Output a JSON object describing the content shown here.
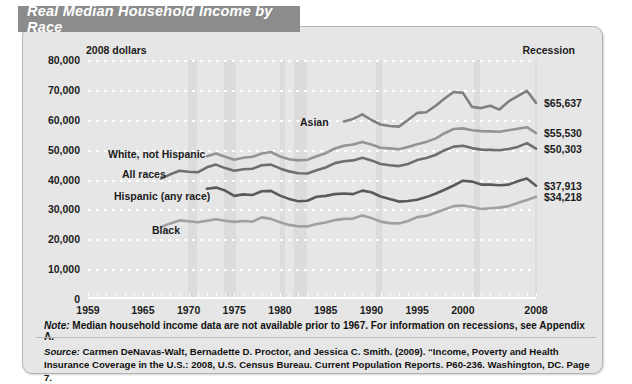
{
  "title": "Real Median Household Income by Race",
  "units_label": "2008 dollars",
  "recession_label": "Recession",
  "note": "Note: Median household income data are not available prior to 1967. For information on recessions, see Appendix A.",
  "note_prefix": "Note:",
  "note_body": " Median household income data are not available prior to 1967. For information on recessions, see Appendix A.",
  "source_prefix": "Source:",
  "source_body": " Carmen DeNavas-Walt, Bernadette D. Proctor, and Jessica C. Smith. (2009). “Income, Poverty and Health Insurance Coverage in the U.S.:  2008, U.S. Census Bureau. Current Population Reports. P60-236. Washington, DC. Page 7.",
  "colors": {
    "banner": "#8c8c8c",
    "card": "#e6e6e6",
    "recession_band": "#dcdcdc",
    "asian": "#808080",
    "white_not_hispanic": "#949494",
    "all_races": "#6e6e6e",
    "hispanic": "#5a5a5a",
    "black": "#a0a0a0"
  },
  "end_labels": [
    {
      "id": "asian",
      "text": "$65,637",
      "value": 65637
    },
    {
      "id": "white_not_hispanic",
      "text": "$55,530",
      "value": 55530
    },
    {
      "id": "all_races",
      "text": "$50,303",
      "value": 50303
    },
    {
      "id": "hispanic",
      "text": "$37,913",
      "value": 37913
    },
    {
      "id": "black",
      "text": "$34,218",
      "value": 34218
    }
  ],
  "inline_labels": [
    {
      "id": "asian",
      "text": "Asian"
    },
    {
      "id": "white_not_hispanic",
      "text": "White, not Hispanic"
    },
    {
      "id": "all_races",
      "text": "All races"
    },
    {
      "id": "hispanic",
      "text": "Hispanic (any race)"
    },
    {
      "id": "black",
      "text": "Black"
    }
  ],
  "chart_data": {
    "type": "line",
    "title": "Real Median Household Income by Race",
    "xlabel": "",
    "ylabel": "2008 dollars",
    "xlim": [
      1959,
      2008
    ],
    "ylim": [
      0,
      80000
    ],
    "ytick_labels": [
      "0",
      "10,000",
      "20,000",
      "30,000",
      "40,000",
      "50,000",
      "60,000",
      "70,000",
      "80,000"
    ],
    "yticks": [
      0,
      10000,
      20000,
      30000,
      40000,
      50000,
      60000,
      70000,
      80000
    ],
    "xtick_labels": [
      "1959",
      "1965",
      "1970",
      "1975",
      "1980",
      "1985",
      "1990",
      "1995",
      "2000",
      "2008"
    ],
    "xticks": [
      1959,
      1965,
      1970,
      1975,
      1980,
      1985,
      1990,
      1995,
      2000,
      2008
    ],
    "grid": "horizontal-dotted",
    "legend": "inline-annotations",
    "recession_bands": [
      [
        1969.9,
        1970.9
      ],
      [
        1973.9,
        1975.2
      ],
      [
        1980.0,
        1980.6
      ],
      [
        1981.5,
        1982.9
      ],
      [
        1990.5,
        1991.2
      ],
      [
        2001.2,
        2001.9
      ],
      [
        2007.9,
        2008.0
      ]
    ],
    "series": [
      {
        "name": "Asian",
        "color": "#808080",
        "x": [
          1987,
          1988,
          1989,
          1990,
          1991,
          1992,
          1993,
          1994,
          1995,
          1996,
          1997,
          1998,
          1999,
          2000,
          2001,
          2002,
          2003,
          2004,
          2005,
          2006,
          2007,
          2008
        ],
        "values": [
          59400,
          60300,
          61800,
          59900,
          58400,
          57900,
          57700,
          59900,
          62300,
          62500,
          64600,
          67100,
          69300,
          69000,
          64300,
          63900,
          64700,
          63400,
          66100,
          67900,
          69700,
          65637
        ]
      },
      {
        "name": "White, not Hispanic",
        "color": "#949494",
        "x": [
          1972,
          1973,
          1974,
          1975,
          1976,
          1977,
          1978,
          1979,
          1980,
          1981,
          1982,
          1983,
          1984,
          1985,
          1986,
          1987,
          1988,
          1989,
          1990,
          1991,
          1992,
          1993,
          1994,
          1995,
          1996,
          1997,
          1998,
          1999,
          2000,
          2001,
          2002,
          2003,
          2004,
          2005,
          2006,
          2007,
          2008
        ],
        "values": [
          47800,
          48700,
          47600,
          46600,
          47300,
          47600,
          48700,
          49200,
          47700,
          46800,
          46400,
          46600,
          47800,
          48800,
          50400,
          51300,
          51700,
          52600,
          51700,
          50600,
          50400,
          50100,
          50900,
          51800,
          52600,
          53700,
          55500,
          56900,
          57100,
          56500,
          56200,
          56100,
          56000,
          56500,
          57000,
          57500,
          55530
        ]
      },
      {
        "name": "All races",
        "color": "#6e6e6e",
        "x": [
          1967,
          1968,
          1969,
          1970,
          1971,
          1972,
          1973,
          1974,
          1975,
          1976,
          1977,
          1978,
          1979,
          1980,
          1981,
          1982,
          1983,
          1984,
          1985,
          1986,
          1987,
          1988,
          1989,
          1990,
          1991,
          1992,
          1993,
          1994,
          1995,
          1996,
          1997,
          1998,
          1999,
          2000,
          2001,
          2002,
          2003,
          2004,
          2005,
          2006,
          2007,
          2008
        ],
        "values": [
          40300,
          41700,
          42900,
          42600,
          42400,
          44100,
          45000,
          43800,
          42900,
          43400,
          43600,
          44800,
          45000,
          43700,
          42700,
          42100,
          42000,
          43100,
          44000,
          45500,
          46100,
          46400,
          47300,
          46400,
          45200,
          44800,
          44500,
          45200,
          46500,
          47200,
          48200,
          49800,
          51000,
          51300,
          50500,
          50000,
          49900,
          49800,
          50200,
          50900,
          52200,
          50303
        ]
      },
      {
        "name": "Hispanic (any race)",
        "color": "#5a5a5a",
        "x": [
          1972,
          1973,
          1974,
          1975,
          1976,
          1977,
          1978,
          1979,
          1980,
          1981,
          1982,
          1983,
          1984,
          1985,
          1986,
          1987,
          1988,
          1989,
          1990,
          1991,
          1992,
          1993,
          1994,
          1995,
          1996,
          1997,
          1998,
          1999,
          2000,
          2001,
          2002,
          2003,
          2004,
          2005,
          2006,
          2007,
          2008
        ],
        "values": [
          36900,
          37300,
          36300,
          34500,
          35000,
          34800,
          36100,
          36200,
          34600,
          33500,
          32700,
          32900,
          34200,
          34500,
          35100,
          35300,
          35100,
          36300,
          35700,
          34300,
          33500,
          32600,
          32800,
          33200,
          34100,
          35200,
          36600,
          38000,
          39600,
          39300,
          38300,
          38300,
          38100,
          38300,
          39400,
          40300,
          37913
        ]
      },
      {
        "name": "Black",
        "color": "#a0a0a0",
        "x": [
          1967,
          1968,
          1969,
          1970,
          1971,
          1972,
          1973,
          1974,
          1975,
          1976,
          1977,
          1978,
          1979,
          1980,
          1981,
          1982,
          1983,
          1984,
          1985,
          1986,
          1987,
          1988,
          1989,
          1990,
          1991,
          1992,
          1993,
          1994,
          1995,
          1996,
          1997,
          1998,
          1999,
          2000,
          2001,
          2002,
          2003,
          2004,
          2005,
          2006,
          2007,
          2008
        ],
        "values": [
          24100,
          25300,
          26300,
          26000,
          25700,
          26200,
          26700,
          26200,
          25800,
          26100,
          25900,
          27300,
          26800,
          25700,
          24800,
          24300,
          24300,
          25100,
          25600,
          26400,
          26800,
          26900,
          28000,
          27100,
          25900,
          25400,
          25300,
          26100,
          27400,
          27800,
          28900,
          30000,
          31100,
          31300,
          30800,
          30100,
          30400,
          30600,
          31100,
          32100,
          33100,
          34218
        ]
      }
    ]
  }
}
